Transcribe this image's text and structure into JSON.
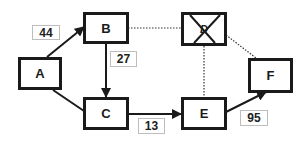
{
  "diagram": {
    "type": "directed-graph",
    "nodes": [
      {
        "id": "A",
        "label": "A",
        "status": "active"
      },
      {
        "id": "B",
        "label": "B",
        "status": "active"
      },
      {
        "id": "C",
        "label": "C",
        "status": "active"
      },
      {
        "id": "D",
        "label": "D",
        "status": "crossed-out"
      },
      {
        "id": "E",
        "label": "E",
        "status": "active"
      },
      {
        "id": "F",
        "label": "F",
        "status": "active"
      }
    ],
    "edges": [
      {
        "from": "A",
        "to": "B",
        "weight": "44",
        "style": "solid",
        "arrow": true
      },
      {
        "from": "B",
        "to": "C",
        "weight": "27",
        "style": "solid",
        "arrow": true
      },
      {
        "from": "A",
        "to": "C",
        "weight": "",
        "style": "solid",
        "arrow": false
      },
      {
        "from": "C",
        "to": "E",
        "weight": "13",
        "style": "solid",
        "arrow": true
      },
      {
        "from": "E",
        "to": "F",
        "weight": "95",
        "style": "solid",
        "arrow": true
      },
      {
        "from": "B",
        "to": "D",
        "weight": "",
        "style": "dotted",
        "arrow": false
      },
      {
        "from": "D",
        "to": "E",
        "weight": "",
        "style": "dotted",
        "arrow": false
      },
      {
        "from": "D",
        "to": "F",
        "weight": "",
        "style": "dotted",
        "arrow": false
      }
    ],
    "labels": {
      "ab": "44",
      "bc": "27",
      "ce": "13",
      "ef": "95"
    }
  }
}
